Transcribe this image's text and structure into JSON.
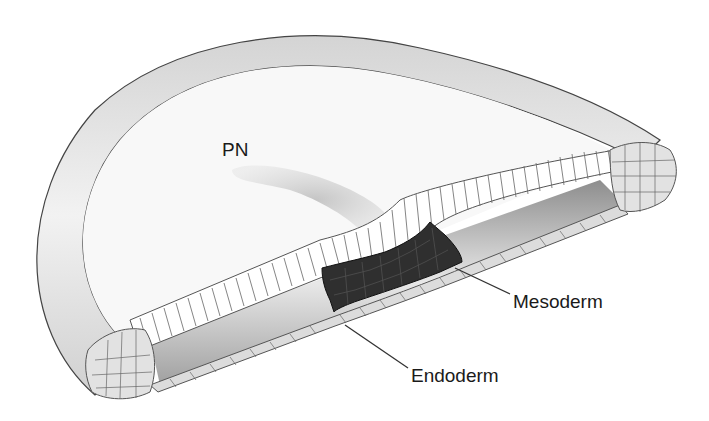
{
  "figure": {
    "labels": {
      "primitive_node": "PN",
      "mesoderm": "Mesoderm",
      "endoderm": "Endoderm"
    },
    "colors": {
      "background": "#ffffff",
      "rim_fill": "#e6e6e6",
      "disc_fill": "#f8f8f8",
      "streak_shadow": "#c8c8c8",
      "ectoderm_cells": "#ffffff",
      "mesoderm_cells": "#2f2f2f",
      "endoderm_cells": "#dcdcdc",
      "cavity_gray": "#9a9a9a"
    }
  }
}
